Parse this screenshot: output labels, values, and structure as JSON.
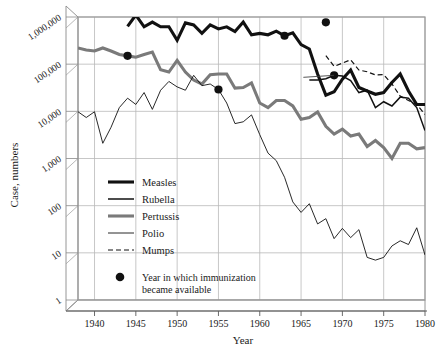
{
  "chart_data": {
    "type": "line",
    "title": "",
    "xlabel": "Year",
    "ylabel": "Case, numbers",
    "xlim": [
      1938,
      1980
    ],
    "ylim": [
      1,
      1000000
    ],
    "yscale": "log",
    "grid": true,
    "legend_position": "inside-lower-left",
    "xticks": [
      "1940",
      "1945",
      "1950",
      "1955",
      "1960",
      "1965",
      "1970",
      "1975",
      "1980"
    ],
    "xtick_values": [
      1940,
      1945,
      1950,
      1955,
      1960,
      1965,
      1970,
      1975,
      1980
    ],
    "yticks": [
      "1,000,000",
      "100,000",
      "10,000",
      "1,000",
      "100",
      "10",
      "1"
    ],
    "ytick_values": [
      1000000,
      100000,
      10000,
      1000,
      100,
      10,
      1
    ],
    "series": [
      {
        "name": "Measles",
        "style": "solid",
        "width": 3.1,
        "color": "#111111",
        "x": [
          1944,
          1945,
          1946,
          1947,
          1948,
          1949,
          1950,
          1951,
          1952,
          1953,
          1954,
          1955,
          1956,
          1957,
          1958,
          1959,
          1960,
          1961,
          1962,
          1963,
          1964,
          1965,
          1966,
          1967,
          1968,
          1969,
          1970,
          1971,
          1972,
          1973,
          1974,
          1975,
          1976,
          1977,
          1978,
          1979,
          1980
        ],
        "y": [
          630000,
          1100000,
          620000,
          780000,
          620000,
          620000,
          320000,
          750000,
          680000,
          450000,
          680000,
          560000,
          620000,
          490000,
          780000,
          420000,
          450000,
          420000,
          500000,
          400000,
          460000,
          260000,
          210000,
          62000,
          22000,
          26000,
          48000,
          75000,
          32000,
          27000,
          23000,
          25000,
          41000,
          62000,
          27000,
          14000,
          14000
        ]
      },
      {
        "name": "Rubella",
        "style": "solid",
        "width": 1.5,
        "color": "#111111",
        "x": [
          1966,
          1967,
          1968,
          1969,
          1970,
          1971,
          1972,
          1973,
          1974,
          1975,
          1976,
          1977,
          1978,
          1979,
          1980
        ],
        "y": [
          46000,
          46000,
          49000,
          58000,
          56000,
          45000,
          25000,
          28000,
          12000,
          16000,
          13000,
          20000,
          19000,
          12000,
          3900
        ]
      },
      {
        "name": "Pertussis",
        "style": "solid",
        "width": 3.1,
        "color": "#7a7a7a",
        "x": [
          1938,
          1939,
          1940,
          1941,
          1942,
          1943,
          1944,
          1945,
          1946,
          1947,
          1948,
          1949,
          1950,
          1951,
          1952,
          1953,
          1954,
          1955,
          1956,
          1957,
          1958,
          1959,
          1960,
          1961,
          1962,
          1963,
          1964,
          1965,
          1966,
          1967,
          1968,
          1969,
          1970,
          1971,
          1972,
          1973,
          1974,
          1975,
          1976,
          1977,
          1978,
          1979,
          1980
        ],
        "y": [
          220000,
          200000,
          190000,
          220000,
          190000,
          160000,
          150000,
          140000,
          160000,
          180000,
          76000,
          68000,
          120000,
          68000,
          46000,
          38000,
          60000,
          62000,
          62000,
          31000,
          32000,
          40000,
          15000,
          12000,
          17000,
          17000,
          13000,
          6800,
          7400,
          9700,
          4800,
          3300,
          4200,
          3000,
          3300,
          1800,
          2400,
          1700,
          1000,
          2100,
          2100,
          1600,
          1700
        ]
      },
      {
        "name": "Polio",
        "style": "solid",
        "width": 0.9,
        "color": "#111111",
        "x": [
          1938,
          1939,
          1940,
          1941,
          1942,
          1943,
          1944,
          1945,
          1946,
          1947,
          1948,
          1949,
          1950,
          1951,
          1952,
          1953,
          1954,
          1955,
          1956,
          1957,
          1958,
          1959,
          1960,
          1961,
          1962,
          1963,
          1964,
          1965,
          1966,
          1967,
          1968,
          1969,
          1970,
          1971,
          1972,
          1973,
          1974,
          1975,
          1976,
          1977,
          1978,
          1979,
          1980
        ],
        "y": [
          9800,
          7400,
          9800,
          2100,
          4600,
          12000,
          19000,
          14000,
          25000,
          11000,
          28000,
          43000,
          33000,
          28000,
          58000,
          35000,
          38000,
          29000,
          15000,
          5500,
          6000,
          8400,
          3200,
          1300,
          900,
          400,
          120,
          72,
          110,
          41,
          53,
          20,
          33,
          21,
          31,
          8,
          7,
          8,
          14,
          18,
          15,
          34,
          9
        ]
      },
      {
        "name": "Mumps",
        "style": "dashed",
        "width": 1.2,
        "color": "#111111",
        "x": [
          1968,
          1969,
          1970,
          1971,
          1972,
          1973,
          1974,
          1975,
          1976,
          1977,
          1978,
          1979,
          1980
        ],
        "y": [
          152000,
          90000,
          105000,
          124000,
          75000,
          69000,
          59000,
          60000,
          38000,
          21000,
          17000,
          14000,
          8600
        ]
      }
    ],
    "markers": {
      "label": "Year in which immunization became available",
      "points": [
        {
          "series": "Pertussis",
          "x": 1944,
          "y": 150000
        },
        {
          "series": "Polio",
          "x": 1955,
          "y": 29000
        },
        {
          "series": "Measles",
          "x": 1963,
          "y": 400000
        },
        {
          "series": "Mumps",
          "x": 1968,
          "y": 770000
        },
        {
          "series": "Rubella",
          "x": 1969,
          "y": 58000
        }
      ]
    }
  },
  "legend": {
    "entries": [
      {
        "label": "Measles"
      },
      {
        "label": "Rubella"
      },
      {
        "label": "Pertussis"
      },
      {
        "label": "Polio"
      },
      {
        "label": "Mumps"
      }
    ],
    "note_line1": "Year in which immunization",
    "note_line2": "became available"
  },
  "axes": {
    "x_title": "Year",
    "y_title": "Case, numbers"
  }
}
